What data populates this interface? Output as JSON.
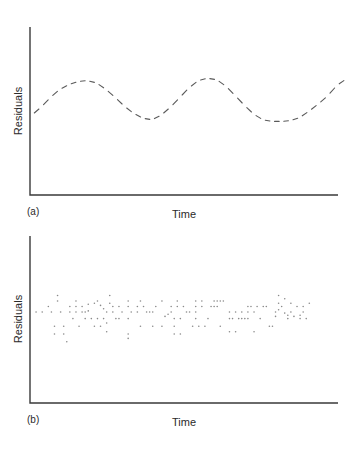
{
  "chart_data": [
    {
      "type": "line",
      "panel_label": "(a)",
      "title": "",
      "xlabel": "Time",
      "ylabel": "Residuals",
      "style": "dashed",
      "grid": false,
      "xlim": [
        0,
        100
      ],
      "ylim": [
        -1,
        1
      ],
      "x": [
        0,
        3,
        6,
        9,
        12,
        15,
        18,
        21,
        24,
        27,
        30,
        33,
        36,
        39,
        42,
        45,
        48,
        51,
        54,
        57,
        60,
        63,
        66,
        69,
        72,
        75,
        78,
        81,
        84,
        87,
        90,
        93,
        96,
        99,
        102
      ],
      "y": [
        -0.1,
        0.0,
        0.12,
        0.22,
        0.28,
        0.32,
        0.33,
        0.3,
        0.22,
        0.12,
        0.01,
        -0.08,
        -0.14,
        -0.16,
        -0.1,
        0.0,
        0.12,
        0.24,
        0.33,
        0.36,
        0.34,
        0.26,
        0.14,
        0.02,
        -0.09,
        -0.16,
        -0.18,
        -0.18,
        -0.17,
        -0.13,
        -0.05,
        0.04,
        0.14,
        0.27,
        0.35
      ]
    },
    {
      "type": "scatter",
      "panel_label": "(b)",
      "title": "",
      "xlabel": "Time",
      "ylabel": "Residuals",
      "grid": false,
      "xlim": [
        0,
        100
      ],
      "ylim": [
        -1,
        1
      ],
      "points": [
        [
          1,
          0.0
        ],
        [
          3,
          0.0
        ],
        [
          5,
          0.05
        ],
        [
          6,
          0.0
        ],
        [
          7,
          -0.13
        ],
        [
          7,
          -0.2
        ],
        [
          8,
          0.15
        ],
        [
          8,
          0.1
        ],
        [
          9,
          0.0
        ],
        [
          10,
          -0.13
        ],
        [
          10,
          -0.2
        ],
        [
          11,
          -0.27
        ],
        [
          12,
          0.05
        ],
        [
          12,
          0.0
        ],
        [
          13,
          -0.06
        ],
        [
          14,
          0.1
        ],
        [
          14,
          0.05
        ],
        [
          14,
          0.0
        ],
        [
          15,
          -0.13
        ],
        [
          16,
          0.05
        ],
        [
          16,
          0.0
        ],
        [
          17,
          0.0
        ],
        [
          17,
          -0.06
        ],
        [
          18,
          0.07
        ],
        [
          18,
          0.01
        ],
        [
          19,
          -0.06
        ],
        [
          20,
          0.08
        ],
        [
          20,
          -0.13
        ],
        [
          21,
          0.1
        ],
        [
          21,
          -0.06
        ],
        [
          22,
          0.06
        ],
        [
          22,
          -0.13
        ],
        [
          23,
          0.03
        ],
        [
          23,
          -0.06
        ],
        [
          24,
          0.0
        ],
        [
          24,
          -0.1
        ],
        [
          24,
          -0.18
        ],
        [
          25,
          0.08
        ],
        [
          25,
          0.15
        ],
        [
          26,
          0.05
        ],
        [
          26,
          0.0
        ],
        [
          27,
          -0.06
        ],
        [
          28,
          0.05
        ],
        [
          28,
          -0.06
        ],
        [
          29,
          0.0
        ],
        [
          31,
          0.1
        ],
        [
          31,
          0.05
        ],
        [
          31,
          -0.06
        ],
        [
          31,
          -0.2
        ],
        [
          31,
          -0.24
        ],
        [
          32,
          0.0
        ],
        [
          34,
          0.05
        ],
        [
          34,
          0.0
        ],
        [
          35,
          0.1
        ],
        [
          35,
          -0.13
        ],
        [
          36,
          0.05
        ],
        [
          37,
          0.0
        ],
        [
          38,
          0.0
        ],
        [
          39,
          0.0
        ],
        [
          39,
          -0.13
        ],
        [
          40,
          0.05
        ],
        [
          42,
          0.1
        ],
        [
          42,
          -0.13
        ],
        [
          43,
          -0.04
        ],
        [
          44,
          -0.02
        ],
        [
          45,
          0.05
        ],
        [
          45,
          0.0
        ],
        [
          46,
          -0.06
        ],
        [
          46,
          -0.13
        ],
        [
          46,
          -0.2
        ],
        [
          47,
          0.05
        ],
        [
          47,
          0.1
        ],
        [
          48,
          -0.06
        ],
        [
          48,
          -0.2
        ],
        [
          49,
          0.05
        ],
        [
          50,
          0.0
        ],
        [
          51,
          0.0
        ],
        [
          52,
          -0.13
        ],
        [
          53,
          0.1
        ],
        [
          53,
          0.05
        ],
        [
          53,
          0.0
        ],
        [
          53,
          -0.06
        ],
        [
          54,
          -0.13
        ],
        [
          55,
          0.1
        ],
        [
          55,
          0.05
        ],
        [
          56,
          -0.13
        ],
        [
          57,
          -0.06
        ],
        [
          58,
          0.05
        ],
        [
          59,
          0.1
        ],
        [
          59,
          0.05
        ],
        [
          60,
          0.1
        ],
        [
          60,
          0.05
        ],
        [
          61,
          0.1
        ],
        [
          61,
          -0.13
        ],
        [
          62,
          0.1
        ],
        [
          64,
          0.0
        ],
        [
          64,
          -0.06
        ],
        [
          64,
          -0.18
        ],
        [
          65,
          -0.06
        ],
        [
          66,
          0.0
        ],
        [
          66,
          -0.18
        ],
        [
          67,
          -0.06
        ],
        [
          68,
          0.0
        ],
        [
          68,
          -0.06
        ],
        [
          69,
          -0.06
        ],
        [
          70,
          0.05
        ],
        [
          70,
          0.0
        ],
        [
          70,
          -0.06
        ],
        [
          71,
          0.05
        ],
        [
          72,
          0.0
        ],
        [
          72,
          -0.18
        ],
        [
          73,
          0.05
        ],
        [
          74,
          -0.06
        ],
        [
          75,
          0.05
        ],
        [
          76,
          0.05
        ],
        [
          77,
          -0.13
        ],
        [
          78,
          -0.13
        ],
        [
          79,
          0.0
        ],
        [
          79,
          -0.04
        ],
        [
          80,
          0.08
        ],
        [
          80,
          0.15
        ],
        [
          80,
          0.02
        ],
        [
          81,
          0.05
        ],
        [
          82,
          -0.01
        ],
        [
          82,
          0.12
        ],
        [
          83,
          -0.06
        ],
        [
          83,
          -0.03
        ],
        [
          84,
          0.08
        ],
        [
          84,
          0.0
        ],
        [
          85,
          -0.04
        ],
        [
          86,
          0.05
        ],
        [
          87,
          -0.03
        ],
        [
          87,
          -0.06
        ],
        [
          88,
          0.05
        ],
        [
          88,
          0.0
        ],
        [
          89,
          -0.06
        ],
        [
          90,
          0.08
        ]
      ]
    }
  ]
}
